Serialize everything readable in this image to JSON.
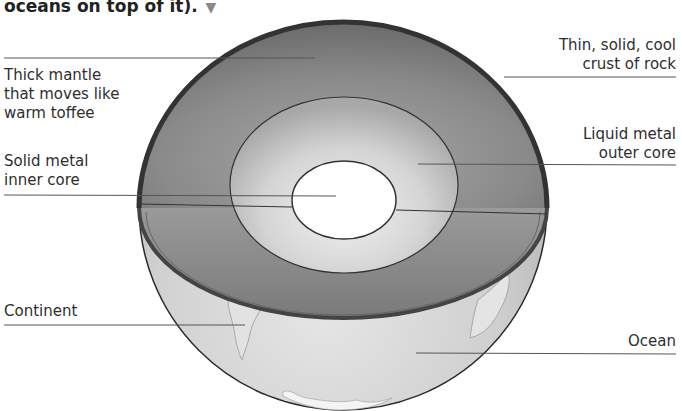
{
  "caption": {
    "text": "oceans on top of it).",
    "arrow_icon": "▼"
  },
  "labels": {
    "mantle": [
      "Thick mantle",
      "that moves like",
      "warm toffee"
    ],
    "inner_core": [
      "Solid metal",
      "inner core"
    ],
    "continent": [
      "Continent"
    ],
    "crust": [
      "Thin, solid, cool",
      "crust of rock"
    ],
    "outer_core": [
      "Liquid metal",
      "outer core"
    ],
    "ocean": [
      "Ocean"
    ]
  },
  "colors": {
    "mantle": "#7d7d7d",
    "crust_rim": "#3a3a3a",
    "outer_core": "#c8c8c8",
    "inner_core": "#ffffff",
    "surface": "#d2d2d2",
    "leader_line": "#555555"
  }
}
